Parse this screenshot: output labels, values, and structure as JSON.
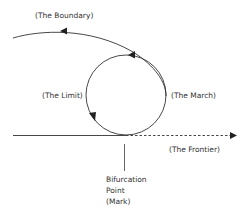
{
  "diagram": {
    "labels": {
      "boundary": "(The Boundary)",
      "limit": "(The Limit)",
      "march": "(The March)",
      "frontier": "(The Frontier)",
      "bifurcation_line1": "Bifurcation",
      "bifurcation_line2": "Point",
      "bifurcation_line3": "(Mark)"
    },
    "colors": {
      "stroke": "#333333",
      "text": "#333333",
      "background": "#ffffff"
    }
  }
}
